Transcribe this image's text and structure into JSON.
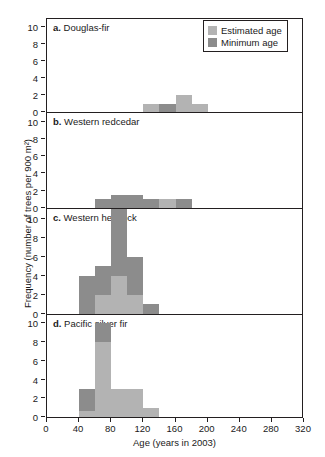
{
  "chart_data": {
    "type": "bar",
    "stacked": true,
    "title": "",
    "xlabel": "Age (years in 2003)",
    "ylabel": "Frequency (number of trees per 900 m²)",
    "xlim": [
      0,
      320
    ],
    "xticks": [
      0,
      40,
      80,
      120,
      160,
      200,
      240,
      280,
      320
    ],
    "ylim": [
      0,
      11
    ],
    "yticks": [
      0,
      2,
      4,
      6,
      8,
      10
    ],
    "bin_width": 20,
    "grid": false,
    "legend_position": "top-right",
    "legend": [
      {
        "name": "Estimated age",
        "color": "#b3b3b3"
      },
      {
        "name": "Minimum age",
        "color": "#8c8c8c"
      }
    ],
    "panels": [
      {
        "letter": "a.",
        "name": "Douglas-fir",
        "bars": [
          {
            "x0": 120,
            "x1": 140,
            "estimated": 1,
            "minimum": 0
          },
          {
            "x0": 140,
            "x1": 160,
            "estimated": 0,
            "minimum": 1
          },
          {
            "x0": 160,
            "x1": 180,
            "estimated": 2,
            "minimum": 0
          },
          {
            "x0": 180,
            "x1": 200,
            "estimated": 1,
            "minimum": 0
          }
        ]
      },
      {
        "letter": "b.",
        "name": "Western redcedar",
        "bars": [
          {
            "x0": 60,
            "x1": 80,
            "estimated": 0,
            "minimum": 1
          },
          {
            "x0": 80,
            "x1": 100,
            "estimated": 0,
            "minimum": 1.5
          },
          {
            "x0": 100,
            "x1": 120,
            "estimated": 0,
            "minimum": 1.5
          },
          {
            "x0": 120,
            "x1": 140,
            "estimated": 0,
            "minimum": 1
          },
          {
            "x0": 140,
            "x1": 160,
            "estimated": 1,
            "minimum": 0
          },
          {
            "x0": 160,
            "x1": 180,
            "estimated": 0,
            "minimum": 1
          }
        ]
      },
      {
        "letter": "c.",
        "name": "Western hemlock",
        "bars": [
          {
            "x0": 40,
            "x1": 60,
            "estimated": 0,
            "minimum": 4
          },
          {
            "x0": 60,
            "x1": 80,
            "estimated": 2,
            "minimum": 3
          },
          {
            "x0": 80,
            "x1": 100,
            "estimated": 4,
            "minimum": 7
          },
          {
            "x0": 100,
            "x1": 120,
            "estimated": 2,
            "minimum": 4
          },
          {
            "x0": 120,
            "x1": 140,
            "estimated": 0,
            "minimum": 1
          }
        ]
      },
      {
        "letter": "d.",
        "name": "Pacific silver fir",
        "bars": [
          {
            "x0": 40,
            "x1": 60,
            "estimated": 0.6,
            "minimum": 2.4
          },
          {
            "x0": 60,
            "x1": 80,
            "estimated": 8,
            "minimum": 2
          },
          {
            "x0": 80,
            "x1": 100,
            "estimated": 3,
            "minimum": 0
          },
          {
            "x0": 100,
            "x1": 120,
            "estimated": 3,
            "minimum": 0
          },
          {
            "x0": 120,
            "x1": 140,
            "estimated": 1,
            "minimum": 0
          }
        ]
      }
    ]
  }
}
